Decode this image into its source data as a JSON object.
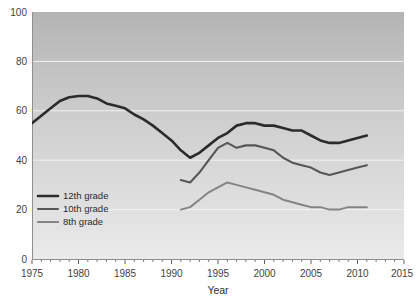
{
  "chart_data": {
    "type": "line",
    "title": "",
    "xlabel": "Year",
    "ylabel": "",
    "xlim": [
      1975,
      2015
    ],
    "ylim": [
      0,
      100
    ],
    "grid": true,
    "legend_position": "inside-bottom-left",
    "x_ticks": [
      1975,
      1980,
      1985,
      1990,
      1995,
      2000,
      2005,
      2010,
      2015
    ],
    "x_minor_tick_step": 1,
    "y_ticks": [
      0,
      20,
      40,
      60,
      80,
      100
    ],
    "series": [
      {
        "name": "12th grade",
        "color": "#2b2b2b",
        "x": [
          1975,
          1976,
          1977,
          1978,
          1979,
          1980,
          1981,
          1982,
          1983,
          1984,
          1985,
          1986,
          1987,
          1988,
          1989,
          1990,
          1991,
          1992,
          1993,
          1994,
          1995,
          1996,
          1997,
          1998,
          1999,
          2000,
          2001,
          2002,
          2003,
          2004,
          2005,
          2006,
          2007,
          2008,
          2009,
          2010,
          2011
        ],
        "values": [
          55,
          58,
          61,
          64,
          65.5,
          66,
          66,
          65,
          63,
          62,
          61,
          58.5,
          56.5,
          54,
          51,
          48,
          44,
          41,
          43,
          46,
          49,
          51,
          54,
          55,
          55,
          54,
          54,
          53,
          52,
          52,
          50,
          48,
          47,
          47,
          48,
          49,
          50
        ]
      },
      {
        "name": "10th grade",
        "color": "#565656",
        "x": [
          1991,
          1992,
          1993,
          1994,
          1995,
          1996,
          1997,
          1998,
          1999,
          2000,
          2001,
          2002,
          2003,
          2004,
          2005,
          2006,
          2007,
          2008,
          2009,
          2010,
          2011
        ],
        "values": [
          32,
          31,
          35,
          40,
          45,
          47,
          45,
          46,
          46,
          45,
          44,
          41,
          39,
          38,
          37,
          35,
          34,
          35,
          36,
          37,
          38
        ]
      },
      {
        "name": "8th grade",
        "color": "#848484",
        "x": [
          1991,
          1992,
          1993,
          1994,
          1995,
          1996,
          1997,
          1998,
          1999,
          2000,
          2001,
          2002,
          2003,
          2004,
          2005,
          2006,
          2007,
          2008,
          2009,
          2010,
          2011
        ],
        "values": [
          20,
          21,
          24,
          27,
          29,
          31,
          30,
          29,
          28,
          27,
          26,
          24,
          23,
          22,
          21,
          21,
          20,
          20,
          21,
          21,
          21
        ]
      }
    ]
  },
  "axis": {
    "x_title": "Year",
    "y_tick_labels": [
      "100",
      "80",
      "60",
      "40",
      "20",
      "0"
    ],
    "x_tick_labels": [
      "1975",
      "1980",
      "1985",
      "1990",
      "1995",
      "2000",
      "2005",
      "2010",
      "2015"
    ]
  },
  "legend": {
    "items": [
      {
        "label": "12th grade",
        "color": "#2b2b2b"
      },
      {
        "label": "10th grade",
        "color": "#565656"
      },
      {
        "label": "8th grade",
        "color": "#848484"
      }
    ]
  },
  "theme": {
    "plot_bg_top": "#b4b4b4",
    "plot_bg_bottom": "#e9e9e9",
    "page_bg": "#ffffff",
    "gridline_color": "#f2f2f2",
    "tick_text_color": "#3f3f3f"
  }
}
